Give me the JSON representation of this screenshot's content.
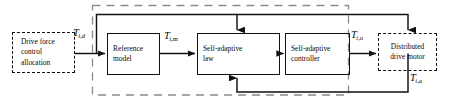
{
  "diagram": {
    "colors": {
      "line": "#111111",
      "dashed_group": "#8c8c8c",
      "text": "#0b0b0b",
      "background": "#ffffff"
    },
    "blocks": [
      {
        "id": "drive-force-control-allocation",
        "style": "dashed",
        "lines": [
          "Drive force",
          "control",
          "allocation"
        ]
      },
      {
        "id": "reference-model",
        "style": "solid",
        "lines": [
          "Reference",
          "model"
        ]
      },
      {
        "id": "self-adaptive-law",
        "style": "solid",
        "lines": [
          "Self-adaptive",
          "law"
        ]
      },
      {
        "id": "self-adaptive-controller",
        "style": "solid",
        "lines": [
          "Self-adaptive",
          "controller"
        ]
      },
      {
        "id": "distributed-drive-motor",
        "style": "dashed",
        "lines": [
          "Distributed",
          "drive motor"
        ]
      }
    ],
    "signals": [
      {
        "id": "t-i-d",
        "base": "T",
        "sub": "i,d"
      },
      {
        "id": "t-i-m",
        "base": "T",
        "sub": "i,m"
      },
      {
        "id": "t-i-u",
        "base": "T",
        "sub": "i,u"
      },
      {
        "id": "t-i-a-feedback",
        "base": "T",
        "sub": "i,a"
      }
    ]
  }
}
